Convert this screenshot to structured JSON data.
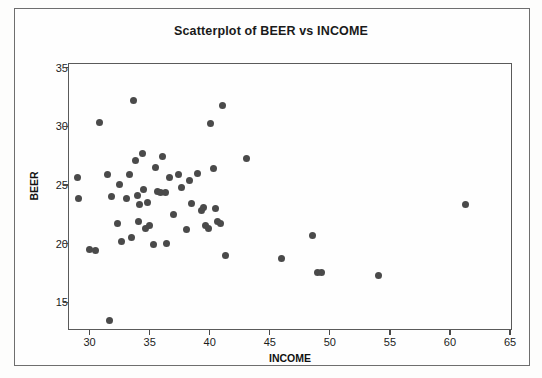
{
  "chart_data": {
    "type": "scatter",
    "title": "Scatterplot of BEER vs INCOME",
    "xlabel": "INCOME",
    "ylabel": "BEER",
    "xlim": [
      28.2,
      65.0
    ],
    "ylim": [
      12.8,
      35.4
    ],
    "xticks": [
      30,
      35,
      40,
      45,
      50,
      55,
      60,
      65
    ],
    "yticks": [
      15,
      20,
      25,
      30,
      35
    ],
    "grid": false,
    "legend": false,
    "marker_color": "#4a4a4a",
    "marker_size": 7,
    "points": [
      {
        "x": 28.9,
        "y": 25.7
      },
      {
        "x": 29.0,
        "y": 23.9
      },
      {
        "x": 29.9,
        "y": 19.6
      },
      {
        "x": 30.4,
        "y": 19.5
      },
      {
        "x": 30.7,
        "y": 30.4
      },
      {
        "x": 31.4,
        "y": 26.0
      },
      {
        "x": 31.6,
        "y": 13.5
      },
      {
        "x": 31.7,
        "y": 24.1
      },
      {
        "x": 32.2,
        "y": 21.8
      },
      {
        "x": 32.4,
        "y": 25.1
      },
      {
        "x": 32.6,
        "y": 20.3
      },
      {
        "x": 33.0,
        "y": 23.9
      },
      {
        "x": 33.2,
        "y": 26.0
      },
      {
        "x": 33.4,
        "y": 20.6
      },
      {
        "x": 33.6,
        "y": 32.3
      },
      {
        "x": 33.7,
        "y": 27.2
      },
      {
        "x": 33.9,
        "y": 24.2
      },
      {
        "x": 34.0,
        "y": 22.0
      },
      {
        "x": 34.1,
        "y": 23.4
      },
      {
        "x": 34.3,
        "y": 27.8
      },
      {
        "x": 34.4,
        "y": 24.7
      },
      {
        "x": 34.6,
        "y": 21.4
      },
      {
        "x": 34.7,
        "y": 23.6
      },
      {
        "x": 34.9,
        "y": 21.6
      },
      {
        "x": 35.2,
        "y": 20.0
      },
      {
        "x": 35.4,
        "y": 26.6
      },
      {
        "x": 35.6,
        "y": 24.5
      },
      {
        "x": 35.8,
        "y": 24.4
      },
      {
        "x": 36.0,
        "y": 27.5
      },
      {
        "x": 36.2,
        "y": 24.4
      },
      {
        "x": 36.3,
        "y": 20.1
      },
      {
        "x": 36.6,
        "y": 25.7
      },
      {
        "x": 36.9,
        "y": 22.6
      },
      {
        "x": 37.3,
        "y": 26.0
      },
      {
        "x": 37.6,
        "y": 24.9
      },
      {
        "x": 38.0,
        "y": 21.3
      },
      {
        "x": 38.2,
        "y": 25.5
      },
      {
        "x": 38.4,
        "y": 23.5
      },
      {
        "x": 38.9,
        "y": 26.1
      },
      {
        "x": 39.2,
        "y": 22.9
      },
      {
        "x": 39.4,
        "y": 23.2
      },
      {
        "x": 39.6,
        "y": 21.6
      },
      {
        "x": 39.8,
        "y": 21.4
      },
      {
        "x": 40.0,
        "y": 30.3
      },
      {
        "x": 40.2,
        "y": 26.5
      },
      {
        "x": 40.4,
        "y": 23.1
      },
      {
        "x": 40.6,
        "y": 22.0
      },
      {
        "x": 40.8,
        "y": 21.8
      },
      {
        "x": 41.0,
        "y": 31.9
      },
      {
        "x": 41.2,
        "y": 19.1
      },
      {
        "x": 43.0,
        "y": 27.3
      },
      {
        "x": 45.9,
        "y": 18.8
      },
      {
        "x": 48.5,
        "y": 20.8
      },
      {
        "x": 48.9,
        "y": 17.6
      },
      {
        "x": 49.2,
        "y": 17.6
      },
      {
        "x": 54.0,
        "y": 17.4
      },
      {
        "x": 61.2,
        "y": 23.4
      }
    ]
  }
}
